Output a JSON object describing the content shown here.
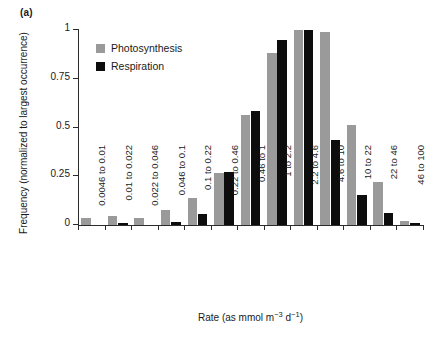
{
  "panel": {
    "label": "(a)"
  },
  "legend": {
    "position": "top-left-inside",
    "entries": [
      {
        "name": "Photosynthesis",
        "color": "#9a9a9a",
        "swatch": "square-swatch-gray"
      },
      {
        "name": "Respiration",
        "color": "#0d0d0d",
        "swatch": "square-swatch-black"
      }
    ]
  },
  "axes": {
    "y_title": "Frequency (normalized to largest occurrence)",
    "x_title_parts": {
      "lead": "Rate (as mmol m",
      "sup1": "−3",
      "mid": " d",
      "sup2": "−1",
      "tail": ")"
    },
    "x_title_plain": "Rate (as mmol m-3 d-1)",
    "y_ticks": [
      "0",
      "0.25",
      "0.5",
      "0.75",
      "1"
    ],
    "y_tick_values": [
      0,
      0.25,
      0.5,
      0.75,
      1
    ]
  },
  "chart_data": {
    "type": "bar",
    "title": "",
    "subtitle": "",
    "xlabel": "Rate (as mmol m-3 d-1)",
    "ylabel": "Frequency (normalized to largest occurrence)",
    "ylim": [
      0,
      1
    ],
    "yticks": [
      0,
      0.25,
      0.5,
      0.75,
      1
    ],
    "grid": false,
    "legend_position": "upper left (inside axes)",
    "categories": [
      "0.0046 to 0.01",
      "0.01 to 0.022",
      "0.022 to 0.046",
      "0.046 to 0.1",
      "0.1 to 0.22",
      "0.22 to 0.46",
      "0.46 to 1",
      "1 to 2.2",
      "2.2 to 4.6",
      "4.6 to 10",
      "10 to 22",
      "22 to 46",
      "46 to 100"
    ],
    "series": [
      {
        "name": "Photosynthesis",
        "color": "#9a9a9a",
        "values": [
          0.035,
          0.045,
          0.035,
          0.075,
          0.14,
          0.265,
          0.565,
          0.88,
          1.0,
          0.99,
          0.515,
          0.22,
          0.02
        ]
      },
      {
        "name": "Respiration",
        "color": "#0d0d0d",
        "values": [
          0.0,
          0.012,
          0.0,
          0.018,
          0.055,
          0.27,
          0.585,
          0.95,
          1.0,
          0.435,
          0.155,
          0.06,
          0.012
        ]
      }
    ]
  }
}
